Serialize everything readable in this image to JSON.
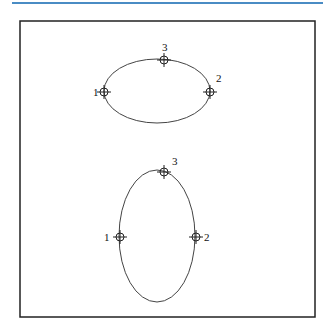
{
  "header_rule_color": "#4a8cc4",
  "diagram": {
    "shapes": [
      {
        "name": "horizontal-ellipse",
        "cx": 157,
        "cy": 91,
        "rx": 53,
        "ry": 32,
        "points": [
          {
            "label": "1",
            "x": 104,
            "y": 92,
            "lx": 93,
            "ly": 96
          },
          {
            "label": "2",
            "x": 210,
            "y": 92,
            "lx": 216,
            "ly": 82
          },
          {
            "label": "3",
            "x": 164,
            "y": 60,
            "lx": 162,
            "ly": 51
          }
        ]
      },
      {
        "name": "vertical-ellipse",
        "cx": 157,
        "cy": 236,
        "rx": 38,
        "ry": 66,
        "points": [
          {
            "label": "1",
            "x": 120,
            "y": 237,
            "lx": 104,
            "ly": 241
          },
          {
            "label": "2",
            "x": 196,
            "y": 237,
            "lx": 204,
            "ly": 241
          },
          {
            "label": "3",
            "x": 164,
            "y": 172,
            "lx": 172,
            "ly": 165
          }
        ]
      }
    ]
  }
}
